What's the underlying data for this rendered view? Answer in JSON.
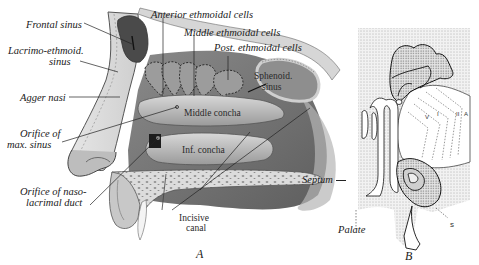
{
  "figure_a": {
    "caption": "A",
    "labels": {
      "frontal_sinus": "Frontal sinus",
      "lacrimo_ethmoid_1": "Lacrimo-ethmoid.",
      "lacrimo_ethmoid_2": "sinus",
      "agger_nasi": "Agger nasi",
      "orifice_max_1": "Orifice of",
      "orifice_max_2": "max. sinus",
      "orifice_naso_1": "Orifice of naso-",
      "orifice_naso_2": "lacrimal duct",
      "anterior_ethmoidal": "Anterior ethmoidal cells",
      "middle_ethmoidal": "Middle ethmoidal cells",
      "post_ethmoidal": "Post. ethmoidal cells",
      "sphenoid_1": "Sphenoid.",
      "sphenoid_2": "sinus",
      "middle_concha": "Middle concha",
      "inf_concha": "Inf. concha",
      "incisive_1": "Incisive",
      "incisive_2": "canal"
    }
  },
  "figure_b": {
    "caption": "B",
    "labels": {
      "septum": "Septum",
      "palate": "Palate",
      "s": "s",
      "i": "I",
      "ii": "II",
      "a": "A",
      "v": "V"
    }
  }
}
